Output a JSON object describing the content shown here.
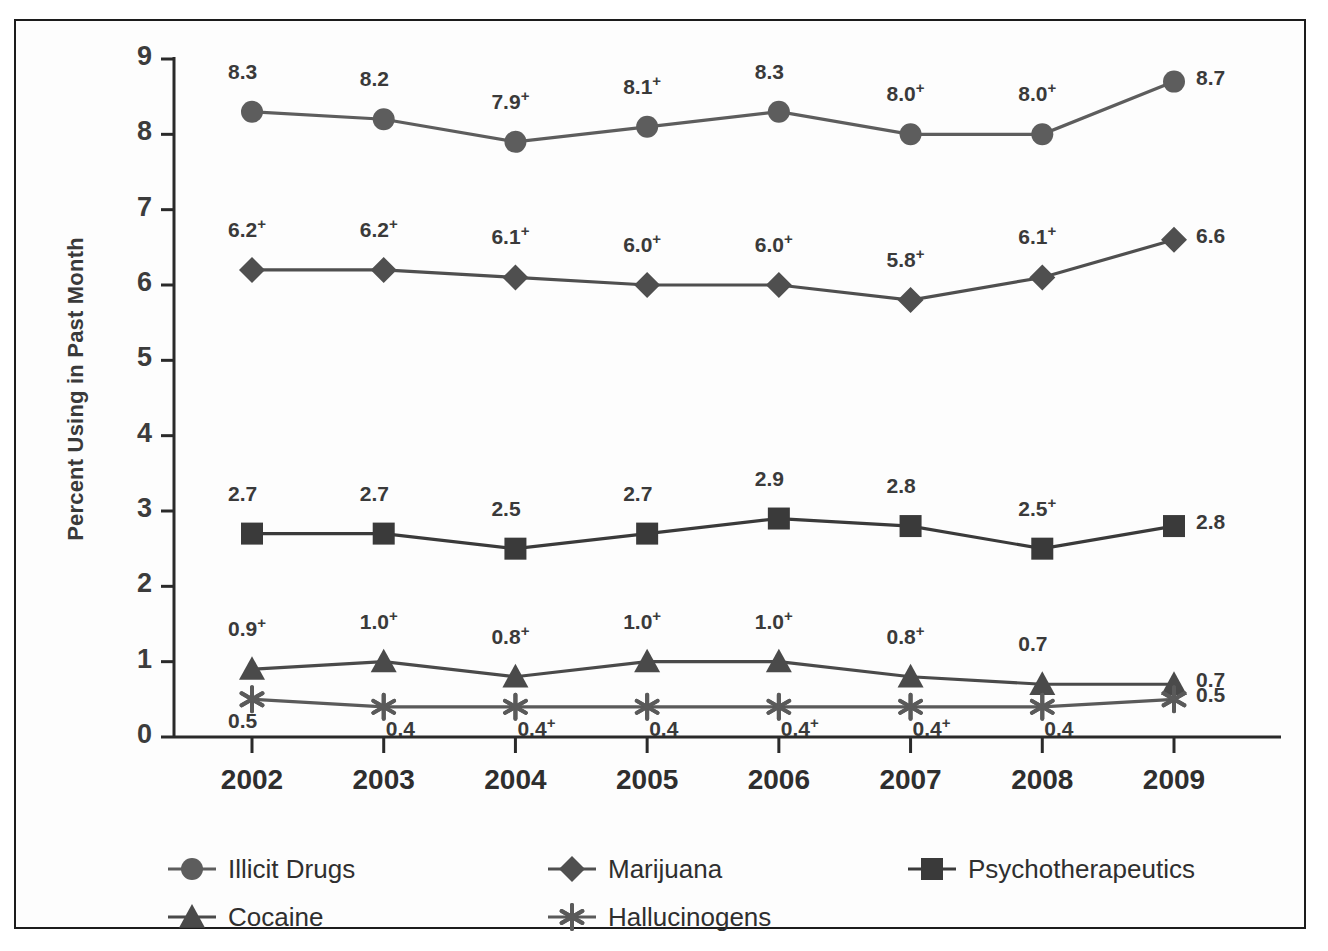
{
  "chart_data": {
    "type": "line",
    "title": "",
    "xlabel": "",
    "ylabel": "Percent Using in Past Month",
    "categories": [
      "2002",
      "2003",
      "2004",
      "2005",
      "2006",
      "2007",
      "2008",
      "2009"
    ],
    "x": [
      2002,
      2003,
      2004,
      2005,
      2006,
      2007,
      2008,
      2009
    ],
    "ylim": [
      0,
      9
    ],
    "yticks": [
      "0",
      "1",
      "2",
      "3",
      "4",
      "5",
      "6",
      "7",
      "8",
      "9"
    ],
    "grid": false,
    "legend_position": "bottom",
    "series": [
      {
        "name": "Illicit Drugs",
        "marker": "circle",
        "color": "#5d5d5d",
        "values": [
          8.3,
          8.2,
          7.9,
          8.1,
          8.3,
          8.0,
          8.0,
          8.7
        ],
        "labels": [
          "8.3",
          "8.2",
          "7.9",
          "8.1",
          "8.3",
          "8.0",
          "8.0",
          "8.7"
        ],
        "significance": [
          "",
          "",
          "+",
          "+",
          "",
          "+",
          "+",
          ""
        ]
      },
      {
        "name": "Marijuana",
        "marker": "diamond",
        "color": "#4f4f4f",
        "values": [
          6.2,
          6.2,
          6.1,
          6.0,
          6.0,
          5.8,
          6.1,
          6.6
        ],
        "labels": [
          "6.2",
          "6.2",
          "6.1",
          "6.0",
          "6.0",
          "5.8",
          "6.1",
          "6.6"
        ],
        "significance": [
          "+",
          "+",
          "+",
          "+",
          "+",
          "+",
          "+",
          ""
        ]
      },
      {
        "name": "Psychotherapeutics",
        "marker": "square",
        "color": "#3a3a3a",
        "values": [
          2.7,
          2.7,
          2.5,
          2.7,
          2.9,
          2.8,
          2.5,
          2.8
        ],
        "labels": [
          "2.7",
          "2.7",
          "2.5",
          "2.7",
          "2.9",
          "2.8",
          "2.5",
          "2.8"
        ],
        "significance": [
          "",
          "",
          "",
          "",
          "",
          "",
          "+",
          ""
        ]
      },
      {
        "name": "Cocaine",
        "marker": "triangle",
        "color": "#4a4a4a",
        "values": [
          0.9,
          1.0,
          0.8,
          1.0,
          1.0,
          0.8,
          0.7,
          0.7
        ],
        "labels": [
          "0.9",
          "1.0",
          "0.8",
          "1.0",
          "1.0",
          "0.8",
          "0.7",
          "0.7"
        ],
        "significance": [
          "+",
          "+",
          "+",
          "+",
          "+",
          "+",
          "",
          ""
        ]
      },
      {
        "name": "Hallucinogens",
        "marker": "asterisk",
        "color": "#5a5a5a",
        "values": [
          0.5,
          0.4,
          0.4,
          0.4,
          0.4,
          0.4,
          0.4,
          0.5
        ],
        "labels": [
          "0.5",
          "0.4",
          "0.4",
          "0.4",
          "0.4",
          "0.4",
          "0.4",
          "0.5"
        ],
        "significance": [
          "",
          "",
          "+",
          "",
          "+",
          "+",
          "",
          ""
        ]
      }
    ],
    "legend": [
      "Illicit Drugs",
      "Marijuana",
      "Psychotherapeutics",
      "Cocaine",
      "Hallucinogens"
    ]
  }
}
